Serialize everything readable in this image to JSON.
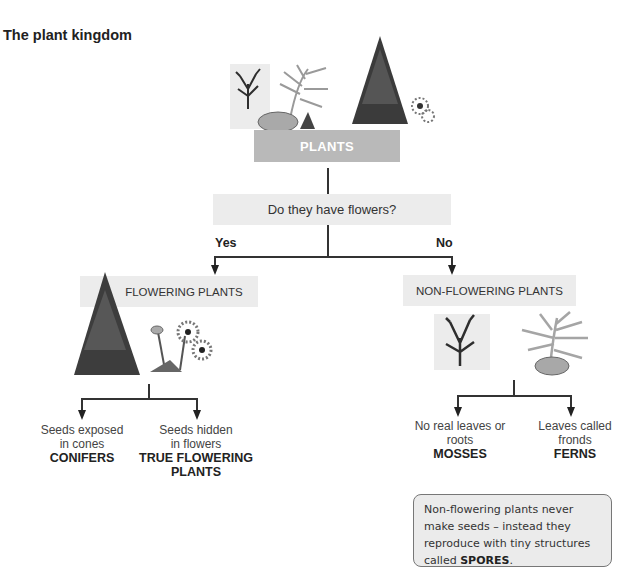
{
  "title": "The plant kingdom",
  "root": {
    "label": "PLANTS"
  },
  "question": {
    "label": "Do they have flowers?",
    "yes_label": "Yes",
    "no_label": "No"
  },
  "flowering": {
    "label": "FLOWERING PLANTS",
    "children": [
      {
        "line1": "Seeds exposed",
        "line2": "in cones",
        "name": "CONIFERS",
        "name2": ""
      },
      {
        "line1": "Seeds hidden",
        "line2": "in flowers",
        "name": "TRUE FLOWERING",
        "name2": "PLANTS"
      }
    ]
  },
  "non_flowering": {
    "label": "NON-FLOWERING PLANTS",
    "children": [
      {
        "line1": "No real leaves or",
        "line2": "roots",
        "name": "MOSSES"
      },
      {
        "line1": "Leaves called",
        "line2": "fronds",
        "name": "FERNS"
      }
    ]
  },
  "note": {
    "text": "Non-flowering plants never make seeds – instead they reproduce with tiny structures called ",
    "emphasis": "SPORES",
    "end": "."
  },
  "colors": {
    "root_box": "#b9b9b9",
    "label_box": "#ececec",
    "lines": "#333333",
    "note_bg": "#ebebeb"
  }
}
